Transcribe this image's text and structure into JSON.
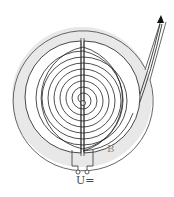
{
  "diagram": {
    "type": "cyclotron",
    "labels": {
      "magnetic_field": "B",
      "voltage": "U="
    },
    "colors": {
      "line": "#333333",
      "field_band": "#e6e6e6",
      "background": "#ffffff"
    },
    "spiral_turns": 10,
    "terminals": 2,
    "exit_arrow": "up-right"
  }
}
